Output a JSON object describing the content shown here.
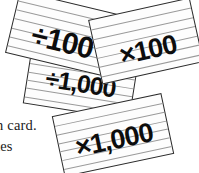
{
  "canvas": {
    "width": 199,
    "height": 173,
    "background_color": "#ffffff"
  },
  "body_text": {
    "line_1": "n card.",
    "line_2": "tes"
  },
  "cards": {
    "card_background_color": "#fdfdfd",
    "card_border_color": "#2b2b2b",
    "rule_line_color": "#9a9a9a",
    "label_color": "#0d0d0d",
    "items": [
      {
        "id": "divide-100",
        "label": "÷100",
        "rule_count": 6,
        "rotation_deg": 13.5,
        "stack_order": 2
      },
      {
        "id": "multiply-100",
        "label": "×100",
        "rule_count": 6,
        "rotation_deg": -12.5,
        "stack_order": 3
      },
      {
        "id": "divide-1000",
        "label": "÷1,000",
        "rule_count": 5,
        "rotation_deg": 9,
        "stack_order": 1
      },
      {
        "id": "multiply-1000",
        "label": "×1,000",
        "rule_count": 6,
        "rotation_deg": -12,
        "stack_order": 4
      }
    ]
  }
}
